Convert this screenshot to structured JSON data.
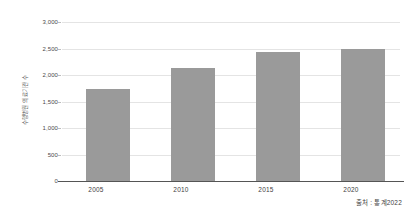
{
  "chart_data": {
    "type": "bar",
    "title": "",
    "subtitle": "",
    "xlabel": "",
    "ylabel": "수행병원 의료기관 수",
    "categories": [
      "2005",
      "2010",
      "2015",
      "2020"
    ],
    "values": [
      1730,
      2140,
      2430,
      2490
    ],
    "series": [
      {
        "name": "수행병원 의료기관 수",
        "values": [
          1730,
          2140,
          2430,
          2490
        ]
      }
    ],
    "ylim": [
      0,
      3000
    ],
    "ytick_values": [
      0,
      500,
      1000,
      1500,
      2000,
      2500,
      3000
    ],
    "ytick_labels": [
      "0",
      "500",
      "1,000",
      "1,500",
      "2,000",
      "2,500",
      "3,000"
    ],
    "grid": true,
    "legend": false,
    "legend_position": "none",
    "bar_color": "#9a9a9a",
    "gridline_color": "#e4e4e4",
    "axis_color": "#555555",
    "background_color": "#ffffff",
    "annotations": [
      {
        "name": "source-note",
        "text": "출처 : 통계2022",
        "position": "bottom-right"
      }
    ]
  },
  "source": {
    "text": "출처 : 통계2022"
  }
}
